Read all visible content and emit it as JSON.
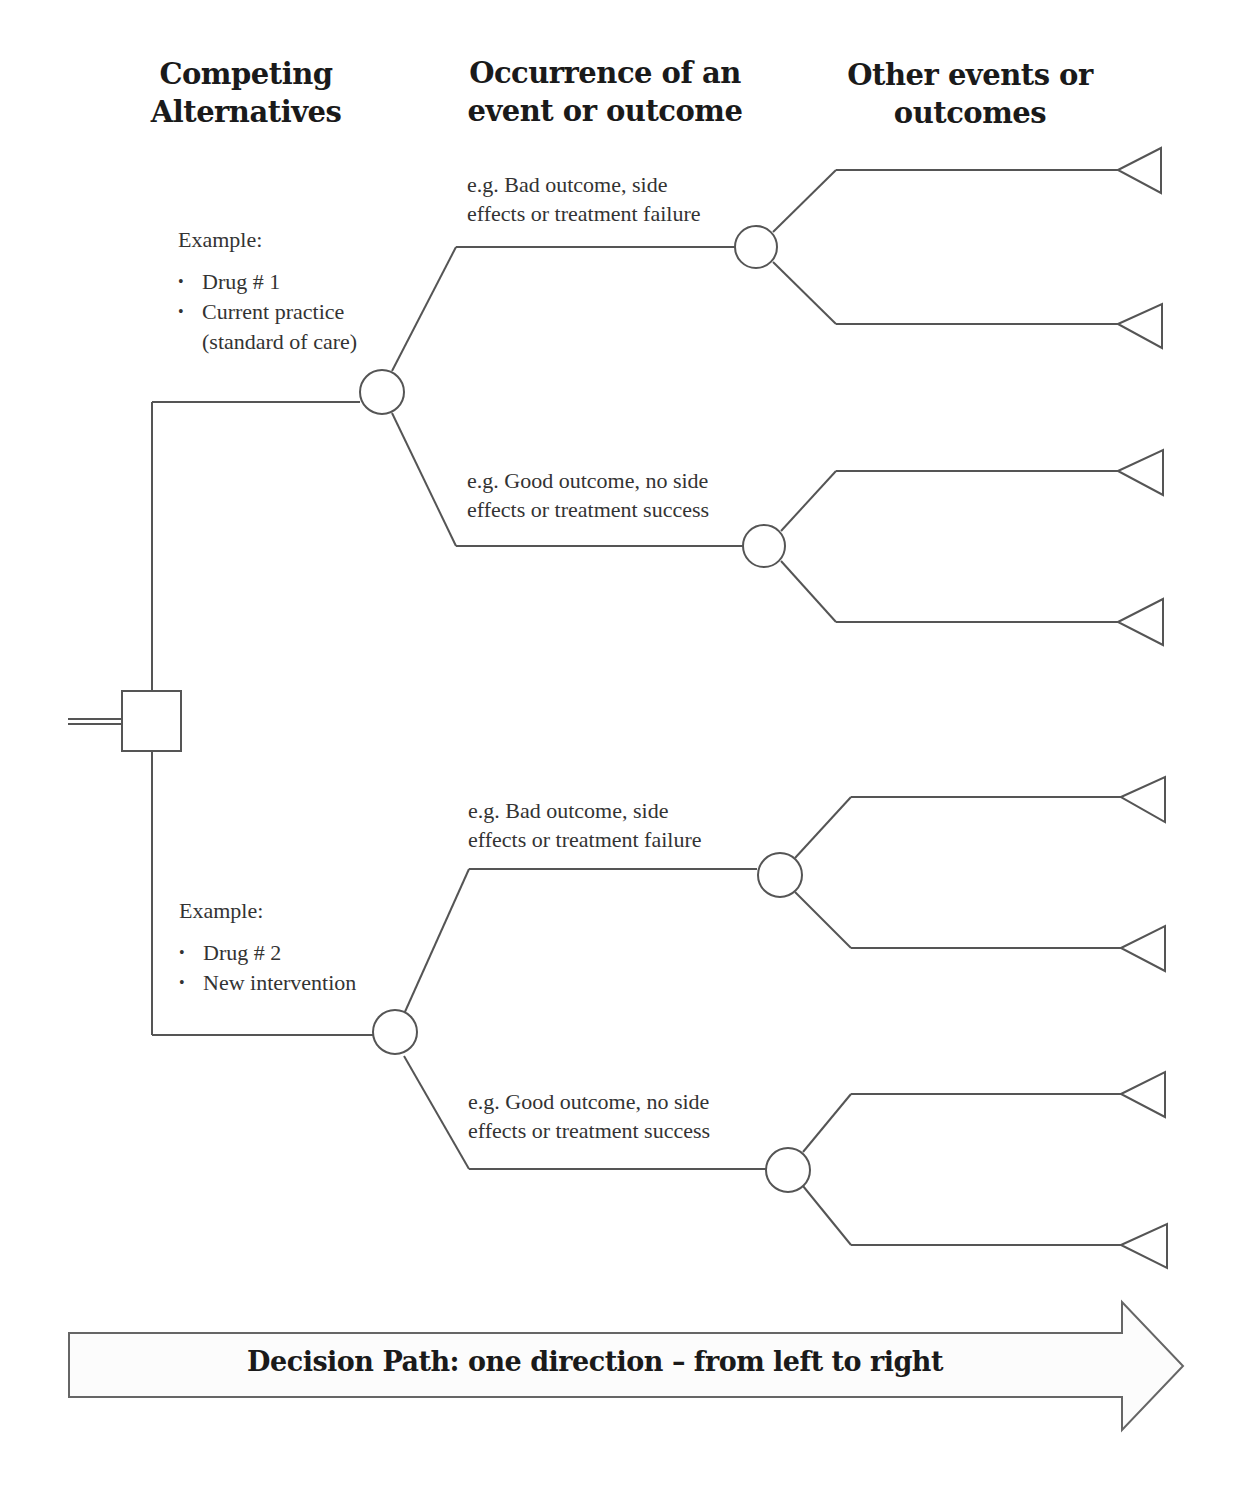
{
  "headers": {
    "col1": [
      "Competing",
      "Alternatives"
    ],
    "col2": [
      "Occurrence of an",
      "event or outcome"
    ],
    "col3": [
      "Other events or",
      "outcomes"
    ]
  },
  "alternatives": [
    {
      "example_label": "Example:",
      "items": [
        "Drug # 1",
        "Current practice",
        "(standard of care)"
      ],
      "outcomes": [
        {
          "lines": [
            "e.g. Bad outcome, side",
            "effects or treatment failure"
          ]
        },
        {
          "lines": [
            "e.g. Good outcome, no  side",
            "effects or treatment success"
          ]
        }
      ]
    },
    {
      "example_label": "Example:",
      "items": [
        "Drug # 2",
        "New intervention"
      ],
      "outcomes": [
        {
          "lines": [
            "e.g. Bad outcome, side",
            "effects or treatment failure"
          ]
        },
        {
          "lines": [
            "e.g. Good outcome, no  side",
            "effects or treatment success"
          ]
        }
      ]
    }
  ],
  "nodes": {
    "decision": "square-decision-node",
    "chance": "circle-chance-node",
    "terminal": "triangle-terminal-node"
  },
  "decision_path_arrow": {
    "label": "Decision Path: one direction – from left to right"
  },
  "colors": {
    "line": "#555555",
    "text": "#333333",
    "header": "#1a1a1a",
    "background": "#ffffff"
  }
}
